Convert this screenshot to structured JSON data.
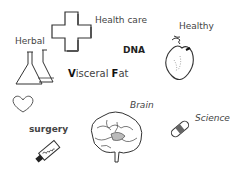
{
  "labels": {
    "health_care": "Health care",
    "healthy": "Healthy",
    "herbal": "Herbal",
    "dna": "DNA",
    "visceral_fat": {
      "v": "V",
      "isceral": "isceral ",
      "f": "F",
      "at": "at"
    },
    "brain": "Brain",
    "science": "Science",
    "surgery": "surgery"
  },
  "icons": [
    "medical-cross-icon",
    "flasks-icon",
    "heart-organ-icon",
    "heart-outline-icon",
    "brain-icon",
    "test-tube-icon",
    "syringe-icon"
  ],
  "colors": {
    "background": "#ffffff",
    "ink": "#333333"
  }
}
